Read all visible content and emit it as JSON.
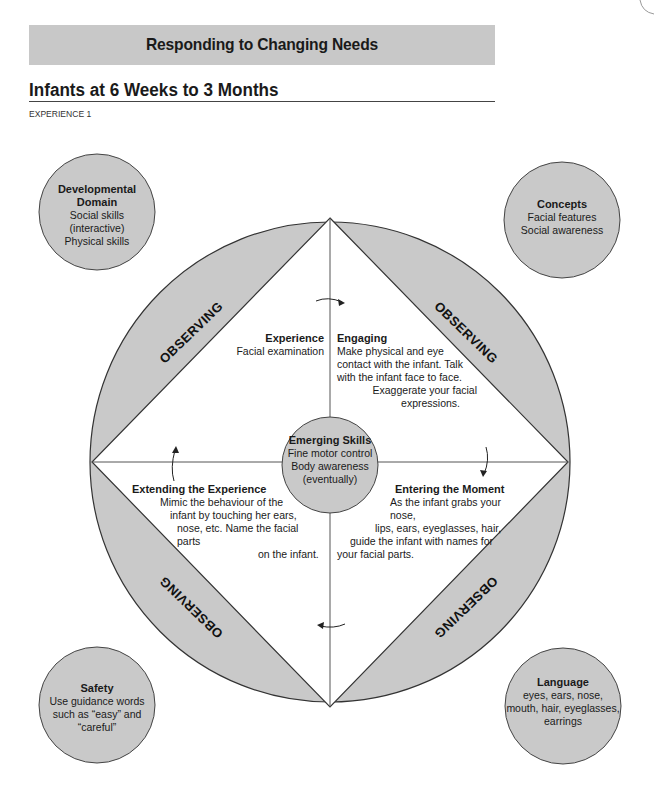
{
  "header": {
    "banner_title": "Responding to Changing Needs",
    "section_title": "Infants at 6 Weeks to 3 Months",
    "experience_label": "EXPERIENCE 1"
  },
  "corner_circles": {
    "developmental_domain": {
      "title_line1": "Developmental",
      "title_line2": "Domain",
      "lines": [
        "Social skills",
        "(interactive)",
        "Physical skills"
      ]
    },
    "concepts": {
      "title": "Concepts",
      "lines": [
        "Facial features",
        "Social awareness"
      ]
    },
    "safety": {
      "title": "Safety",
      "lines": [
        "Use guidance words",
        "such as “easy” and",
        "“careful”"
      ]
    },
    "language": {
      "title": "Language",
      "lines": [
        "eyes, ears, nose,",
        "mouth, hair, eyeglasses,",
        "earrings"
      ]
    }
  },
  "diagram": {
    "observing_label": "OBSERVING",
    "experience": {
      "title": "Experience",
      "text": "Facial examination"
    },
    "engaging": {
      "title": "Engaging",
      "lines": [
        "Make physical and eye",
        "contact with the infant. Talk",
        "with the infant face to face.",
        "Exaggerate your facial",
        "expressions."
      ]
    },
    "emerging_skills": {
      "title": "Emerging Skills",
      "lines": [
        "Fine motor control",
        "Body awareness",
        "(eventually)"
      ]
    },
    "extending": {
      "title": "Extending the Experience",
      "lines": [
        "Mimic the behaviour of the",
        "infant by touching her ears,",
        "nose, etc. Name the facial parts",
        "on the infant."
      ]
    },
    "entering": {
      "title": "Entering the Moment",
      "lines": [
        "As the infant grabs your nose,",
        "lips, ears, eyeglasses, hair,",
        "guide the infant with names for",
        "your facial parts."
      ]
    }
  },
  "colors": {
    "gray_fill": "#c9c9c9",
    "banner": "#c8c8c8",
    "stroke": "#333333"
  }
}
